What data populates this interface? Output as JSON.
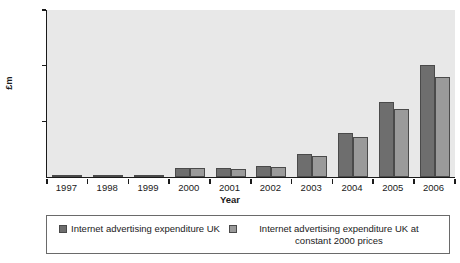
{
  "chart_data": {
    "type": "bar",
    "title": "",
    "xlabel": "Year",
    "ylabel": "£m",
    "categories": [
      "1997",
      "1998",
      "1999",
      "2000",
      "2001",
      "2002",
      "2003",
      "2004",
      "2005",
      "2006"
    ],
    "series": [
      {
        "name": "Internet advertising expenditure UK",
        "values": [
          2,
          8,
          35,
          155,
          166,
          197,
          407,
          790,
          1350,
          2010
        ]
      },
      {
        "name": "Internet advertising expenditure UK at constant 2000 prices",
        "values": [
          2,
          8,
          33,
          155,
          152,
          183,
          383,
          723,
          1215,
          1800
        ]
      }
    ],
    "ylim": [
      0,
      3000
    ],
    "yticks": [
      0,
      1000,
      2000,
      3000
    ],
    "ytick_labels": [
      "0",
      "1000",
      "2000",
      "3000"
    ],
    "grid": false,
    "legend_position": "bottom",
    "colors": {
      "series_0": "#6e6e6e",
      "series_1": "#9a9a9a",
      "plot_background": "#e8e8e8",
      "axis": "#1a1a1a",
      "bar_border": "#4a4a4a"
    }
  }
}
